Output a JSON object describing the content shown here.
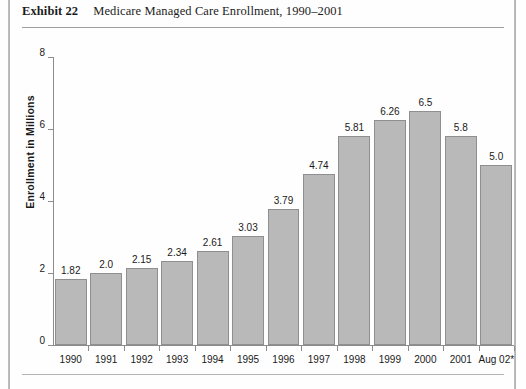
{
  "page": {
    "background": "#fefefe",
    "edge_rule_color": "#9a9a9a"
  },
  "exhibit": {
    "label": "Exhibit 22",
    "title": "Medicare Managed Care Enrollment, 1990–2001"
  },
  "chart_data": {
    "type": "bar",
    "title": "Medicare Managed Care Enrollment, 1990–2001",
    "xlabel": "",
    "ylabel": "Enrollment in Millions",
    "ylim": [
      0,
      8
    ],
    "yticks": [
      0,
      2,
      4,
      6,
      8
    ],
    "ytick_labels": [
      "0",
      "2",
      "4",
      "6",
      "8"
    ],
    "grid": false,
    "legend": null,
    "bar_color": "#b9b9b9",
    "bar_border_color": "#8f8f8f",
    "categories": [
      "1990",
      "1991",
      "1992",
      "1993",
      "1994",
      "1995",
      "1996",
      "1997",
      "1998",
      "1999",
      "2000",
      "2001",
      "Aug 02*"
    ],
    "values": [
      1.82,
      2.0,
      2.15,
      2.34,
      2.61,
      3.03,
      3.79,
      4.74,
      5.81,
      6.26,
      6.5,
      5.8,
      5.0
    ],
    "data_labels": [
      "1.82",
      "2.0",
      "2.15",
      "2.34",
      "2.61",
      "3.03",
      "3.79",
      "4.74",
      "5.81",
      "6.26",
      "6.5",
      "5.8",
      "5.0"
    ]
  }
}
